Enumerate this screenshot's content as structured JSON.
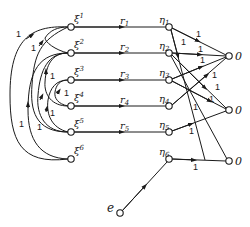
{
  "diagram": {
    "type": "network-graph",
    "xi_nodes": [
      {
        "id": "xi1",
        "label": "ξ",
        "index": "1",
        "x": 71,
        "y": 27
      },
      {
        "id": "xi2",
        "label": "ξ",
        "index": "2",
        "x": 71,
        "y": 53
      },
      {
        "id": "xi3",
        "label": "ξ",
        "index": "3",
        "x": 71,
        "y": 80
      },
      {
        "id": "xi4",
        "label": "ξ",
        "index": "4",
        "x": 71,
        "y": 106
      },
      {
        "id": "xi5",
        "label": "ξ",
        "index": "5",
        "x": 71,
        "y": 132
      },
      {
        "id": "xi6",
        "label": "ξ",
        "index": "6",
        "x": 71,
        "y": 159
      }
    ],
    "eta_nodes": [
      {
        "id": "eta1",
        "label": "η",
        "index": "1",
        "x": 169,
        "y": 27
      },
      {
        "id": "eta2",
        "label": "η",
        "index": "2",
        "x": 169,
        "y": 53
      },
      {
        "id": "eta3",
        "label": "η",
        "index": "3",
        "x": 169,
        "y": 80
      },
      {
        "id": "eta4",
        "label": "η",
        "index": "4",
        "x": 169,
        "y": 106
      },
      {
        "id": "eta5",
        "label": "η",
        "index": "5",
        "x": 169,
        "y": 132
      },
      {
        "id": "eta6",
        "label": "η",
        "index": "6",
        "x": 169,
        "y": 159
      }
    ],
    "r_labels": [
      {
        "label": "r",
        "index": "1"
      },
      {
        "label": "r",
        "index": "2"
      },
      {
        "label": "r",
        "index": "3"
      },
      {
        "label": "r",
        "index": "4"
      },
      {
        "label": "r",
        "index": "5"
      }
    ],
    "output_nodes": [
      {
        "id": "o1",
        "label": "0",
        "x": 229,
        "y": 56
      },
      {
        "id": "o2",
        "label": "0",
        "x": 229,
        "y": 110
      },
      {
        "id": "o3",
        "label": "0",
        "x": 229,
        "y": 161
      }
    ],
    "source_node": {
      "id": "e",
      "label": "e",
      "x": 120,
      "y": 213
    },
    "edge_weight": "1",
    "left_arc_weights": [
      "1",
      "1",
      "1",
      "1",
      "1",
      "1",
      "1"
    ],
    "right_edge_weights": [
      "1",
      "1",
      "1",
      "1",
      "1",
      "1",
      "1",
      "1",
      "1",
      "1"
    ]
  }
}
